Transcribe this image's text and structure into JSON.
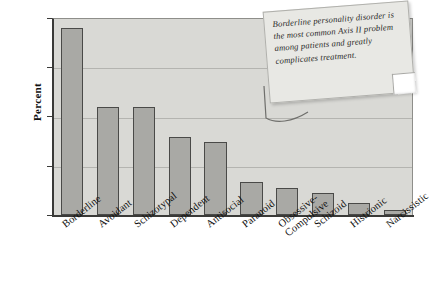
{
  "chart_data": {
    "type": "bar",
    "title": "",
    "xlabel": "",
    "ylabel": "Percent",
    "ylim": [
      0,
      40
    ],
    "yticks": [
      0,
      10,
      20,
      30,
      40
    ],
    "grid": true,
    "legend": "none",
    "categories": [
      "Borderline",
      "Avoidant",
      "Schizotypal",
      "Dependent",
      "Antisocial",
      "Paranoid",
      "Obsessive-Compulsive",
      "Schizoid",
      "Histrionic",
      "Narcissistic"
    ],
    "values": [
      38,
      22,
      22,
      15.8,
      14.8,
      6.7,
      5.5,
      4.5,
      2.5,
      1
    ],
    "series": [
      {
        "name": "Percent",
        "values": [
          38,
          22,
          22,
          15.8,
          14.8,
          6.7,
          5.5,
          4.5,
          2.5,
          1
        ]
      }
    ],
    "annotations": [
      {
        "name": "callout-note",
        "text": "Borderline personality disorder is the most common Axis II problem among patients and greatly complicates treatment."
      }
    ]
  },
  "axis": {
    "y_title": "Percent",
    "y_tick_labels": [
      "0",
      "10",
      "20",
      "30",
      "40"
    ]
  },
  "category_labels": [
    {
      "line1": "Borderline",
      "line2": ""
    },
    {
      "line1": "Avoidant",
      "line2": ""
    },
    {
      "line1": "Schizotypal",
      "line2": ""
    },
    {
      "line1": "Dependent",
      "line2": ""
    },
    {
      "line1": "Antisocial",
      "line2": ""
    },
    {
      "line1": "Paranoid",
      "line2": ""
    },
    {
      "line1": "Obsessive-",
      "line2": "Compulsive"
    },
    {
      "line1": "Schizoid",
      "line2": ""
    },
    {
      "line1": "Histrionic",
      "line2": ""
    },
    {
      "line1": "Narcissistic",
      "line2": ""
    }
  ],
  "callout": {
    "text": "Borderline personality disorder is the most common Axis II problem among patients and greatly complicates treatment."
  },
  "colors": {
    "bar_fill": "#a9a9a5",
    "bar_stroke": "#4a4a48",
    "plot_background": "#d9d9d5",
    "gridline": "#b4b4b0",
    "axis": "#3a3a38",
    "note_background": "#e8e8e4",
    "figure_background": "#ffffff"
  }
}
